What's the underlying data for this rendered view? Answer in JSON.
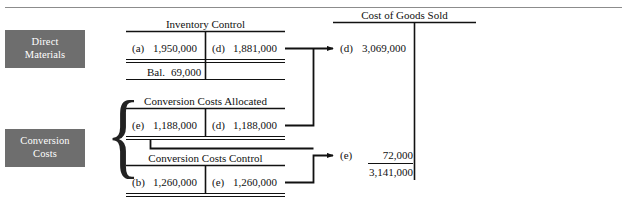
{
  "diagram": {
    "type": "t-account-flow",
    "title_rule": "top-divider-rule",
    "categories": [
      {
        "id": "direct-materials",
        "lines": [
          "Direct",
          "Materials"
        ],
        "color": "#6e6e6e"
      },
      {
        "id": "conversion-costs",
        "lines": [
          "Conversion",
          "Costs"
        ],
        "color": "#6e6e6e"
      }
    ],
    "accounts": [
      {
        "id": "inventory-control",
        "title": "Inventory Control",
        "debit": {
          "ref": "(a)",
          "amount": "1,950,000"
        },
        "credit": {
          "ref": "(d)",
          "amount": "1,881,000"
        },
        "balance": {
          "label": "Bal.",
          "amount": "69,000"
        }
      },
      {
        "id": "conversion-costs-allocated",
        "title": "Conversion Costs Allocated",
        "debit": {
          "ref": "(e)",
          "amount": "1,188,000"
        },
        "credit": {
          "ref": "(d)",
          "amount": "1,188,000"
        }
      },
      {
        "id": "conversion-costs-control",
        "title": "Conversion Costs Control",
        "debit": {
          "ref": "(b)",
          "amount": "1,260,000"
        },
        "credit": {
          "ref": "(e)",
          "amount": "1,260,000"
        }
      },
      {
        "id": "cost-of-goods-sold",
        "title": "Cost of Goods Sold",
        "entries": [
          {
            "ref": "(d)",
            "amount": "3,069,000"
          },
          {
            "ref": "(e)",
            "amount": "72,000"
          }
        ],
        "total": "3,141,000"
      }
    ],
    "flows": [
      {
        "from": "inventory-control.credit",
        "to": "cost-of-goods-sold.entry-d",
        "ref": "(d)"
      },
      {
        "from": "conversion-costs-allocated.credit",
        "to": "cost-of-goods-sold.entry-d",
        "ref": "(d)"
      },
      {
        "from": "conversion-costs-control.credit",
        "to": "cost-of-goods-sold.entry-e",
        "ref": "(e)"
      },
      {
        "from": "conversion-costs-allocated.debit",
        "to": "conversion-costs-control",
        "ref": "(e)"
      }
    ]
  }
}
